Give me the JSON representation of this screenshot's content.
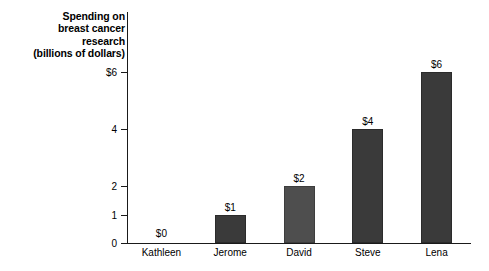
{
  "chart_data": {
    "type": "bar",
    "title": "Spending on breast cancer research (billions of dollars)",
    "title_lines": [
      "Spending on",
      "breast cancer",
      "research",
      "(billions of dollars)"
    ],
    "xlabel": "",
    "ylabel": "Spending on breast cancer research (billions of dollars)",
    "categories": [
      "Kathleen",
      "Jerome",
      "David",
      "Steve",
      "Lena"
    ],
    "values": [
      0,
      1,
      2,
      4,
      6
    ],
    "data_labels": [
      "$0",
      "$1",
      "$2",
      "$4",
      "$6"
    ],
    "ytick_values": [
      0,
      1,
      2,
      4,
      6
    ],
    "ytick_labels": [
      "0",
      "1",
      "2",
      "4",
      "$6"
    ],
    "ylim": [
      0,
      6.6
    ],
    "grid": false,
    "legend": false,
    "bar_colors": [
      "#3a3a3a",
      "#3a3a3a",
      "#4e4e4e",
      "#3a3a3a",
      "#3a3a3a"
    ],
    "axis_color": "#1a1a1a",
    "background_color": "#ffffff",
    "text_color": "#000000"
  }
}
